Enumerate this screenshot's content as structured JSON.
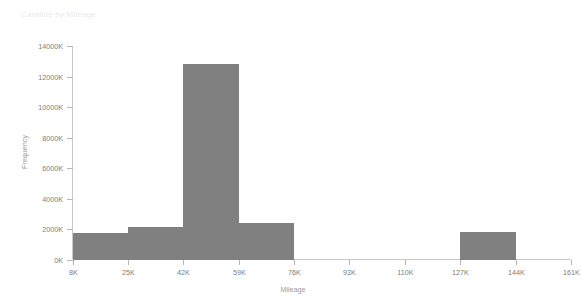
{
  "chart_data": {
    "type": "bar",
    "title": "Cardfine by Mileage",
    "xlabel": "Mileage",
    "ylabel": "Frequency",
    "grid": false,
    "legend": "none",
    "bar_color": "#808080",
    "background_color": "#ffffff",
    "axis_color": "#c9c9c9",
    "tick_label_color": "#7d7d7d",
    "title_color": "#e9e9ec",
    "xlim": [
      8000,
      161000
    ],
    "ylim": [
      0,
      14000000
    ],
    "bin_width": 17000,
    "xticks": [
      8000,
      25000,
      42000,
      59000,
      76000,
      93000,
      110000,
      127000,
      144000,
      161000
    ],
    "xtick_labels": [
      "8K",
      "25K",
      "42K",
      "59K",
      "76K",
      "93K",
      "110K",
      "127K",
      "144K",
      "161K"
    ],
    "yticks": [
      0,
      2000000,
      4000000,
      6000000,
      8000000,
      10000000,
      12000000,
      14000000
    ],
    "ytick_labels": [
      "0K",
      "2000K",
      "4000K",
      "6000K",
      "8000K",
      "10000K",
      "12000K",
      "14000K"
    ],
    "bins": [
      {
        "left": 8000,
        "right": 25000,
        "label": "8K-25K",
        "value": 1750000
      },
      {
        "left": 25000,
        "right": 42000,
        "label": "25K-42K",
        "value": 2100000
      },
      {
        "left": 42000,
        "right": 59000,
        "label": "42K-59K",
        "value": 12800000
      },
      {
        "left": 59000,
        "right": 76000,
        "label": "59K-76K",
        "value": 2400000
      },
      {
        "left": 76000,
        "right": 93000,
        "label": "76K-93K",
        "value": 0
      },
      {
        "left": 93000,
        "right": 110000,
        "label": "93K-110K",
        "value": 0
      },
      {
        "left": 110000,
        "right": 127000,
        "label": "110K-127K",
        "value": 0
      },
      {
        "left": 127000,
        "right": 144000,
        "label": "127K-144K",
        "value": 1800000
      },
      {
        "left": 144000,
        "right": 161000,
        "label": "144K-161K",
        "value": 0
      }
    ],
    "categories": [
      "8K-25K",
      "25K-42K",
      "42K-59K",
      "59K-76K",
      "76K-93K",
      "93K-110K",
      "110K-127K",
      "127K-144K",
      "144K-161K"
    ],
    "values": [
      1750000,
      2100000,
      12800000,
      2400000,
      0,
      0,
      0,
      1800000,
      0
    ]
  }
}
